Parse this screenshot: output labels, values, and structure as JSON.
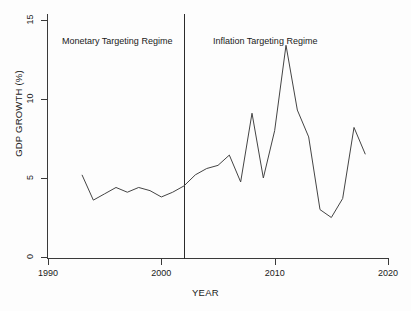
{
  "chart_data": {
    "type": "line",
    "title": "",
    "xlabel": "YEAR",
    "ylabel": "GDP GROWTH (%)",
    "xlim": [
      1990,
      2020
    ],
    "ylim": [
      0,
      15
    ],
    "xticks": [
      1990,
      2000,
      2010,
      2020
    ],
    "yticks": [
      0,
      5,
      10,
      15
    ],
    "grid": false,
    "legend": "none",
    "series": [
      {
        "name": "GDP growth",
        "color": "#444444",
        "x": [
          1993,
          1994,
          1995,
          1996,
          1997,
          1998,
          1999,
          2000,
          2001,
          2002,
          2003,
          2004,
          2005,
          2006,
          2007,
          2008,
          2009,
          2010,
          2011,
          2012,
          2013,
          2014,
          2015,
          2016,
          2017,
          2018
        ],
        "values": [
          5.2,
          3.6,
          4.0,
          4.4,
          4.1,
          4.4,
          4.2,
          3.8,
          4.1,
          4.5,
          5.2,
          5.6,
          5.8,
          6.45,
          4.75,
          9.1,
          5.0,
          8.0,
          13.4,
          9.3,
          7.6,
          3.0,
          2.5,
          3.7,
          8.2,
          6.5
        ]
      }
    ],
    "annotations": [
      {
        "text": "Monetary Targeting Regime",
        "x": 1991.3,
        "y": 13.6
      },
      {
        "text": "Inflation Targeting Regime",
        "x": 2004.6,
        "y": 13.6
      }
    ],
    "vertical_lines": [
      {
        "x": 2002,
        "color": "#2b2b2b",
        "label": "regime-change-divider"
      }
    ]
  }
}
